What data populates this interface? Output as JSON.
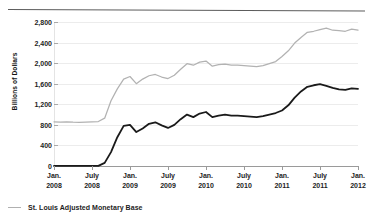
{
  "chart_data": {
    "type": "line",
    "title": "",
    "xlabel": "",
    "ylabel": "Billions of Dollars",
    "ylim": [
      0,
      2800
    ],
    "yticks": [
      0,
      400,
      800,
      1200,
      1600,
      2000,
      2400,
      2800
    ],
    "ytick_labels": [
      "0",
      "400",
      "800",
      "1,200",
      "1,600",
      "2,000",
      "2,400",
      "2,800"
    ],
    "grid": true,
    "legend_position": "bottom-left",
    "xtick_labels": [
      {
        "line1": "Jan.",
        "line2": "2008"
      },
      {
        "line1": "July",
        "line2": "2008"
      },
      {
        "line1": "Jan.",
        "line2": "2009"
      },
      {
        "line1": "July",
        "line2": "2009"
      },
      {
        "line1": "Jan.",
        "line2": "2010"
      },
      {
        "line1": "July",
        "line2": "2010"
      },
      {
        "line1": "Jan.",
        "line2": "2011"
      },
      {
        "line1": "July",
        "line2": "2011"
      },
      {
        "line1": "Jan.",
        "line2": "2012"
      }
    ],
    "x": [
      "2008-01",
      "2008-02",
      "2008-03",
      "2008-04",
      "2008-05",
      "2008-06",
      "2008-07",
      "2008-08",
      "2008-09",
      "2008-10",
      "2008-11",
      "2008-12",
      "2009-01",
      "2009-02",
      "2009-03",
      "2009-04",
      "2009-05",
      "2009-06",
      "2009-07",
      "2009-08",
      "2009-09",
      "2009-10",
      "2009-11",
      "2009-12",
      "2010-01",
      "2010-02",
      "2010-03",
      "2010-04",
      "2010-05",
      "2010-06",
      "2010-07",
      "2010-08",
      "2010-09",
      "2010-10",
      "2010-11",
      "2010-12",
      "2011-01",
      "2011-02",
      "2011-03",
      "2011-04",
      "2011-05",
      "2011-06",
      "2011-07",
      "2011-08",
      "2011-09",
      "2011-10",
      "2011-11",
      "2011-12",
      "2012-01"
    ],
    "series": [
      {
        "name": "St. Louis Adjusted Monetary Base",
        "color": "#b2b2b2",
        "values": [
          860,
          855,
          858,
          852,
          850,
          855,
          860,
          865,
          930,
          1270,
          1500,
          1690,
          1740,
          1600,
          1690,
          1755,
          1780,
          1730,
          1700,
          1765,
          1880,
          1990,
          1960,
          2020,
          2040,
          1940,
          1970,
          1980,
          1960,
          1960,
          1950,
          1940,
          1930,
          1950,
          1990,
          2030,
          2130,
          2240,
          2390,
          2500,
          2600,
          2620,
          2650,
          2680,
          2640,
          2630,
          2620,
          2660,
          2640
        ]
      },
      {
        "name": "Excess Reserves",
        "color": "#1a1a1a",
        "values": [
          2,
          2,
          3,
          3,
          3,
          2,
          2,
          2,
          60,
          270,
          560,
          780,
          800,
          660,
          730,
          820,
          850,
          790,
          740,
          800,
          910,
          1000,
          950,
          1020,
          1050,
          950,
          980,
          1000,
          980,
          980,
          970,
          960,
          950,
          970,
          1000,
          1030,
          1080,
          1180,
          1330,
          1450,
          1540,
          1570,
          1590,
          1560,
          1520,
          1490,
          1480,
          1510,
          1500
        ]
      }
    ]
  },
  "legend": {
    "items": [
      {
        "label": "St. Louis Adjusted Monetary Base",
        "color": "#b2b2b2"
      }
    ]
  }
}
